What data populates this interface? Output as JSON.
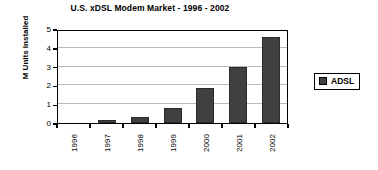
{
  "chart_data": {
    "type": "bar",
    "title": "U.S. xDSL Modem Market - 1996 - 2002",
    "xlabel": "",
    "ylabel": "M Units Installed",
    "categories": [
      "1996",
      "1997",
      "1998",
      "1999",
      "2000",
      "2001",
      "2002"
    ],
    "values": [
      0,
      0.15,
      0.3,
      0.8,
      1.85,
      3.0,
      4.6
    ],
    "series": [
      {
        "name": "ADSL",
        "values": [
          0,
          0.15,
          0.3,
          0.8,
          1.85,
          3.0,
          4.6
        ]
      }
    ],
    "ylim": [
      0,
      5
    ],
    "yticks": [
      0,
      1,
      2,
      3,
      4,
      5
    ],
    "ytick_labels": [
      "0",
      "1",
      "2",
      "3",
      "4",
      "5"
    ],
    "grid": "horizontal",
    "legend": {
      "position": "right",
      "entries": [
        {
          "label": "ADSL",
          "color": "#404040"
        }
      ]
    },
    "colors": {
      "bar_fill": "#404040",
      "bar_border": "#2b2b2b",
      "gridline": "#b9b9b9",
      "axis": "#000000",
      "background": "#ffffff"
    }
  }
}
